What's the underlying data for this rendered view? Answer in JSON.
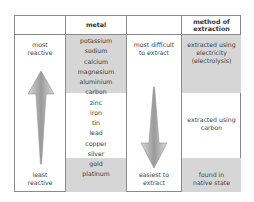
{
  "table": {
    "headers": [
      "",
      "metal",
      "",
      "method of extraction"
    ],
    "reactivity": {
      "top_label": "most reactive",
      "bottom_label": "least reactive",
      "arrow_direction": "up"
    },
    "metals": [
      "potassium",
      "sodium",
      "calcium",
      "magnesium",
      "aluminium",
      "carbon",
      "zinc",
      "iron",
      "tin",
      "lead",
      "copper",
      "silver",
      "gold",
      "platinum"
    ],
    "difficulty": {
      "top_label": "most difficult to extract",
      "bottom_label": "easiest to extract",
      "arrow_direction": "down"
    },
    "methods": [
      {
        "label": "extracted using electricity (electrolysis)",
        "applies_to": [
          "potassium",
          "sodium",
          "calcium",
          "magnesium",
          "aluminium"
        ]
      },
      {
        "label": "extracted using carbon",
        "applies_to": [
          "zinc",
          "iron",
          "tin",
          "lead",
          "copper"
        ]
      },
      {
        "label": "found in native state",
        "applies_to": [
          "silver",
          "gold",
          "platinum"
        ]
      }
    ],
    "colors": {
      "shade": "#d6d6d6",
      "border": "#8a8a8a",
      "arrow": "#bdbdbd"
    }
  }
}
